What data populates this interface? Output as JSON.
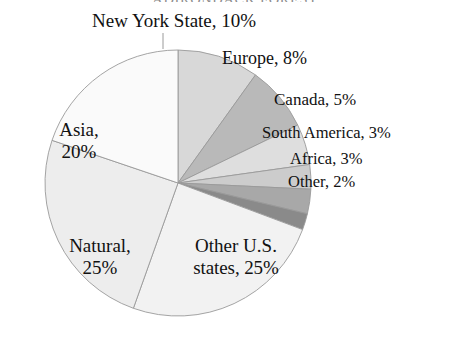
{
  "chart_data": {
    "type": "pie",
    "title": "ADIRONDACK FOREST",
    "title_cropped": true,
    "labels": [
      "New York State",
      "Europe",
      "Canada",
      "South America",
      "Africa",
      "Other",
      "Other U.S. states",
      "Natural",
      "Asia"
    ],
    "values": [
      10,
      8,
      5,
      3,
      3,
      2,
      25,
      25,
      20
    ],
    "value_suffix": "%",
    "start_angle_deg": 0,
    "direction": "clockwise",
    "grid": false,
    "legend": "none",
    "labels_position": "callout",
    "slices": [
      {
        "name": "New York State",
        "value": 10,
        "label": "New York State, 10%",
        "color": "#d8d8d8",
        "leader_line": true
      },
      {
        "name": "Europe",
        "value": 8,
        "label": "Europe, 8%",
        "color": "#b9b9b9",
        "leader_line": false
      },
      {
        "name": "Canada",
        "value": 5,
        "label": "Canada, 5%",
        "color": "#dedede",
        "leader_line": false
      },
      {
        "name": "South America",
        "value": 3,
        "label": "South America, 3%",
        "color": "#cccccc",
        "leader_line": false
      },
      {
        "name": "Africa",
        "value": 3,
        "label": "Africa, 3%",
        "color": "#a8a8a8",
        "leader_line": false
      },
      {
        "name": "Other",
        "value": 2,
        "label": "Other, 2%",
        "color": "#8a8a8a",
        "leader_line": false
      },
      {
        "name": "Other U.S. states",
        "value": 25,
        "label_line1": "Other U.S.",
        "label_line2": "states, 25%",
        "label": "Other U.S. states, 25%",
        "color": "#f2f2f2",
        "leader_line": false
      },
      {
        "name": "Natural",
        "value": 25,
        "label_line1": "Natural,",
        "label_line2": "25%",
        "label": "Natural, 25%",
        "color": "#ededed",
        "leader_line": false
      },
      {
        "name": "Asia",
        "value": 20,
        "label_line1": "Asia,",
        "label_line2": "20%",
        "label": "Asia, 20%",
        "color": "#fafafa",
        "leader_line": false
      }
    ],
    "geometry": {
      "cx": 178,
      "cy": 183,
      "r": 133
    },
    "stroke_color": "#9a9a9a"
  }
}
